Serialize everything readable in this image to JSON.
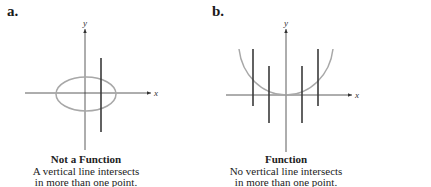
{
  "panels": [
    {
      "label": "a.",
      "title": "Not a Function",
      "line1": "A vertical line intersects",
      "line2": "in more than one point.",
      "graph": "ellipse",
      "x_axis_label": "x",
      "y_axis_label": "y"
    },
    {
      "label": "b.",
      "title": "Function",
      "line1": "No vertical line intersects",
      "line2": "in more than one point.",
      "graph": "parabola-like U curve",
      "x_axis_label": "x",
      "y_axis_label": "y"
    }
  ],
  "colors": {
    "axis": "#333333",
    "curve": "#a8a8a8",
    "vertical_line": "#3a3a3a"
  }
}
